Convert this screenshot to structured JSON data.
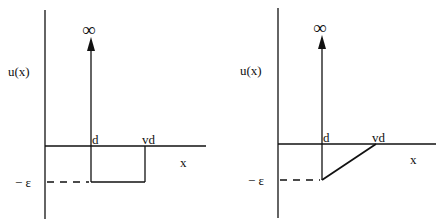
{
  "panels": [
    {
      "ylabel": "u(x)",
      "xlabel": "x",
      "infinity": "∞",
      "d_label": "d",
      "vd_label": "vd",
      "eps_label": "− ε",
      "shape": "square well"
    },
    {
      "ylabel": "u(x)",
      "xlabel": "x",
      "infinity": "∞",
      "d_label": "d",
      "vd_label": "vd",
      "eps_label": "− ε",
      "shape": "triangular well"
    }
  ]
}
